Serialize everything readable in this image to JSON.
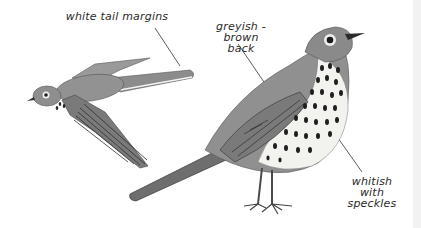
{
  "illustration": {
    "subject": "song thrush",
    "figures": [
      "flying-bird",
      "standing-bird"
    ]
  },
  "labels": {
    "tail": "white tail margins",
    "back_line1": "greyish - brown",
    "back_line2": "back",
    "breast_line1": "whitish with",
    "breast_line2": "speckles"
  },
  "colors": {
    "background": "#ffffff",
    "plumage": "#8a8a8a",
    "dark": "#2a2a2a",
    "edge": "#f2f2f2"
  }
}
